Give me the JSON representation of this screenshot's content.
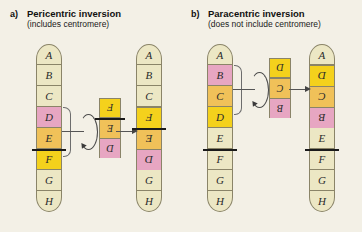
{
  "diagram": {
    "colors": {
      "cream": "#ece7c4",
      "pink": "#e7a6c2",
      "orange": "#f0c159",
      "yellow": "#f4d11c",
      "centromere": "#1a1a1a",
      "background": "#f3f0e6"
    }
  },
  "panels": {
    "a": {
      "letter": "a)",
      "title": "Pericentric inversion",
      "subtitle": "(includes centromere)",
      "original": {
        "name": "original-chromosome-a",
        "bands": [
          {
            "label": "A",
            "color": "cream",
            "flipped": false
          },
          {
            "label": "B",
            "color": "cream",
            "flipped": false
          },
          {
            "label": "C",
            "color": "cream",
            "flipped": false
          },
          {
            "label": "D",
            "color": "pink",
            "flipped": false
          },
          {
            "label": "E",
            "color": "orange",
            "flipped": false
          },
          {
            "label": "F",
            "color": "yellow",
            "flipped": false
          },
          {
            "label": "G",
            "color": "cream",
            "flipped": false
          },
          {
            "label": "H",
            "color": "cream",
            "flipped": false
          }
        ],
        "centromere_after_index": 4,
        "bracket_from_index": 3,
        "bracket_to_index": 5
      },
      "fragment": {
        "name": "inverted-fragment-a",
        "bands": [
          {
            "label": "F",
            "color": "yellow",
            "flipped": true
          },
          {
            "label": "E",
            "color": "orange",
            "flipped": true
          },
          {
            "label": "D",
            "color": "pink",
            "flipped": true
          }
        ],
        "centromere_after_index": 0
      },
      "result": {
        "name": "result-chromosome-a",
        "bands": [
          {
            "label": "A",
            "color": "cream",
            "flipped": false
          },
          {
            "label": "B",
            "color": "cream",
            "flipped": false
          },
          {
            "label": "C",
            "color": "cream",
            "flipped": false
          },
          {
            "label": "F",
            "color": "yellow",
            "flipped": true
          },
          {
            "label": "E",
            "color": "orange",
            "flipped": true
          },
          {
            "label": "D",
            "color": "pink",
            "flipped": true
          },
          {
            "label": "G",
            "color": "cream",
            "flipped": false
          },
          {
            "label": "H",
            "color": "cream",
            "flipped": false
          }
        ],
        "centromere_after_index": 3
      }
    },
    "b": {
      "letter": "b)",
      "title": "Paracentric inversion",
      "subtitle": "(does not include centromere)",
      "original": {
        "name": "original-chromosome-b",
        "bands": [
          {
            "label": "A",
            "color": "cream",
            "flipped": false
          },
          {
            "label": "B",
            "color": "pink",
            "flipped": false
          },
          {
            "label": "C",
            "color": "orange",
            "flipped": false
          },
          {
            "label": "D",
            "color": "yellow",
            "flipped": false
          },
          {
            "label": "E",
            "color": "cream",
            "flipped": false
          },
          {
            "label": "F",
            "color": "cream",
            "flipped": false
          },
          {
            "label": "G",
            "color": "cream",
            "flipped": false
          },
          {
            "label": "H",
            "color": "cream",
            "flipped": false
          }
        ],
        "centromere_after_index": 4,
        "bracket_from_index": 1,
        "bracket_to_index": 3
      },
      "fragment": {
        "name": "inverted-fragment-b",
        "bands": [
          {
            "label": "D",
            "color": "yellow",
            "flipped": true
          },
          {
            "label": "C",
            "color": "orange",
            "flipped": true
          },
          {
            "label": "B",
            "color": "pink",
            "flipped": true
          }
        ],
        "centromere_after_index": -1
      },
      "result": {
        "name": "result-chromosome-b",
        "bands": [
          {
            "label": "A",
            "color": "cream",
            "flipped": false
          },
          {
            "label": "D",
            "color": "yellow",
            "flipped": true
          },
          {
            "label": "C",
            "color": "orange",
            "flipped": true
          },
          {
            "label": "B",
            "color": "pink",
            "flipped": true
          },
          {
            "label": "E",
            "color": "cream",
            "flipped": false
          },
          {
            "label": "F",
            "color": "cream",
            "flipped": false
          },
          {
            "label": "G",
            "color": "cream",
            "flipped": false
          },
          {
            "label": "H",
            "color": "cream",
            "flipped": false
          }
        ],
        "centromere_after_index": 4
      }
    }
  }
}
